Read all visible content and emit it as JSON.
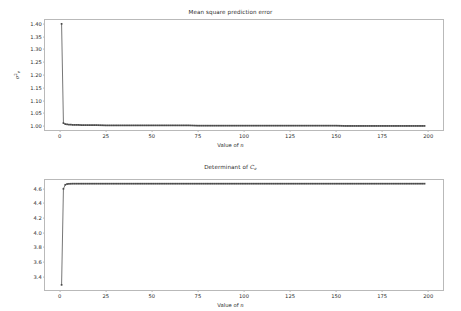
{
  "figure": {
    "width": 461,
    "height": 311,
    "background": "#ffffff",
    "line_color": "#4a4a4a",
    "marker_color": "#4a4a4a",
    "frame_color": "#b9b9b9"
  },
  "chart_data": [
    {
      "type": "line",
      "title": "Mean square prediction error",
      "title_parts": {
        "text": "Mean square prediction error"
      },
      "xlabel": "Value of n",
      "xlabel_parts": {
        "prefix": "Value of ",
        "math": "n"
      },
      "ylabel": "σ²_e",
      "ylabel_parts": {
        "symbol": "σ",
        "superscript": "2",
        "subscript": "e"
      },
      "xlim": [
        -8,
        208
      ],
      "ylim": [
        0.985,
        1.415
      ],
      "xticks": [
        0,
        25,
        50,
        75,
        100,
        125,
        150,
        175,
        200
      ],
      "xticklabels": [
        "0",
        "25",
        "50",
        "75",
        "100",
        "125",
        "150",
        "175",
        "200"
      ],
      "yticks": [
        1.0,
        1.05,
        1.1,
        1.15,
        1.2,
        1.25,
        1.3,
        1.35,
        1.4
      ],
      "yticklabels": [
        "1.00",
        "1.05",
        "1.10",
        "1.15",
        "1.20",
        "1.25",
        "1.30",
        "1.35",
        "1.40"
      ],
      "grid": false,
      "legend": null,
      "marker": "square",
      "x": [
        1,
        2,
        3,
        4,
        5,
        6,
        7,
        8,
        9,
        10,
        12,
        14,
        16,
        18,
        20,
        25,
        30,
        35,
        40,
        45,
        50,
        55,
        60,
        65,
        70,
        75,
        80,
        85,
        90,
        95,
        100,
        105,
        110,
        115,
        120,
        125,
        130,
        135,
        140,
        145,
        150,
        155,
        160,
        165,
        170,
        175,
        180,
        185,
        190,
        195,
        198
      ],
      "values": [
        1.4,
        1.012,
        1.008,
        1.007,
        1.006,
        1.006,
        1.005,
        1.005,
        1.005,
        1.005,
        1.004,
        1.004,
        1.004,
        1.004,
        1.004,
        1.003,
        1.003,
        1.003,
        1.003,
        1.003,
        1.003,
        1.003,
        1.003,
        1.003,
        1.003,
        1.002,
        1.002,
        1.002,
        1.002,
        1.002,
        1.002,
        1.002,
        1.002,
        1.002,
        1.002,
        1.002,
        1.002,
        1.002,
        1.002,
        1.002,
        1.002,
        1.001,
        1.001,
        1.001,
        1.001,
        1.001,
        1.001,
        1.001,
        1.001,
        1.001,
        1.001
      ]
    },
    {
      "type": "line",
      "title": "Determinant of C_e",
      "title_parts": {
        "prefix": "Determinant of ",
        "math": "C",
        "subscript": "e"
      },
      "xlabel": "Value of n",
      "xlabel_parts": {
        "prefix": "Value of ",
        "math": "n"
      },
      "ylabel": "detC_e",
      "ylabel_parts": {
        "symbol": "det",
        "math": "C",
        "subscript": "e"
      },
      "xlim": [
        -8,
        208
      ],
      "ylim": [
        3.22,
        4.72
      ],
      "xticks": [
        0,
        25,
        50,
        75,
        100,
        125,
        150,
        175,
        200
      ],
      "xticklabels": [
        "0",
        "25",
        "50",
        "75",
        "100",
        "125",
        "150",
        "175",
        "200"
      ],
      "yticks": [
        3.4,
        3.6,
        3.8,
        4.0,
        4.2,
        4.4,
        4.6
      ],
      "yticklabels": [
        "3.4",
        "3.6",
        "3.8",
        "4.0",
        "4.2",
        "4.4",
        "4.6"
      ],
      "grid": false,
      "legend": null,
      "marker": "square",
      "x": [
        1,
        2,
        3,
        4,
        5,
        6,
        7,
        8,
        9,
        10,
        12,
        14,
        16,
        18,
        20,
        25,
        30,
        35,
        40,
        45,
        50,
        55,
        60,
        65,
        70,
        75,
        80,
        85,
        90,
        95,
        100,
        105,
        110,
        115,
        120,
        125,
        130,
        135,
        140,
        145,
        150,
        155,
        160,
        165,
        170,
        175,
        180,
        185,
        190,
        195,
        198
      ],
      "values": [
        3.29,
        4.6,
        4.655,
        4.665,
        4.668,
        4.669,
        4.67,
        4.67,
        4.67,
        4.67,
        4.67,
        4.67,
        4.67,
        4.67,
        4.67,
        4.67,
        4.67,
        4.67,
        4.67,
        4.67,
        4.67,
        4.67,
        4.67,
        4.67,
        4.67,
        4.67,
        4.67,
        4.67,
        4.67,
        4.67,
        4.67,
        4.67,
        4.67,
        4.67,
        4.67,
        4.67,
        4.67,
        4.67,
        4.67,
        4.67,
        4.67,
        4.67,
        4.67,
        4.67,
        4.67,
        4.67,
        4.67,
        4.67,
        4.67,
        4.67,
        4.67
      ]
    }
  ]
}
